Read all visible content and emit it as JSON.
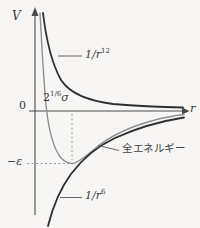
{
  "figure": {
    "background": "#f7f6f4",
    "colors": {
      "axis": "#4a4a4a",
      "dark_curve": "#2f2f2f",
      "light_curve": "#8f8f8f",
      "dashed_guide": "#9a9a9a",
      "leader_line": "#555555",
      "text": "#3a3a3a"
    },
    "axes": {
      "y_label": "V",
      "x_label": "r",
      "origin_label": "0"
    },
    "curves": {
      "repulsive": {
        "label_base": "1/r",
        "label_sup": "12",
        "path": "M43,13 C46,38 51,62 61,80 C71,95 90,101 113,104 C138,106 162,107 183,107.5"
      },
      "total": {
        "label": "全エネルギー",
        "path": "M40,13 C42,50 44,88 46.5,109 C48.5,127 53,148 61,158 C65.5,162.5 69,163.5 72.5,163.5 C77,163 84,158 95,148.5 C110,136 132,126 155,120 C166,117 176,115.5 184,114.5"
      },
      "attractive": {
        "label_base": "1/r",
        "label_sup": "6",
        "path": "M48,226 C53,206 60,189 71,174 C83,158 98,146 115,138 C138,127.5 162,121 184,117.5"
      }
    },
    "annotations": {
      "minimum_position": {
        "base": "2",
        "sup": "1/6",
        "suffix": "σ"
      },
      "well_depth": {
        "minus": "−",
        "symbol": "ε"
      }
    }
  }
}
